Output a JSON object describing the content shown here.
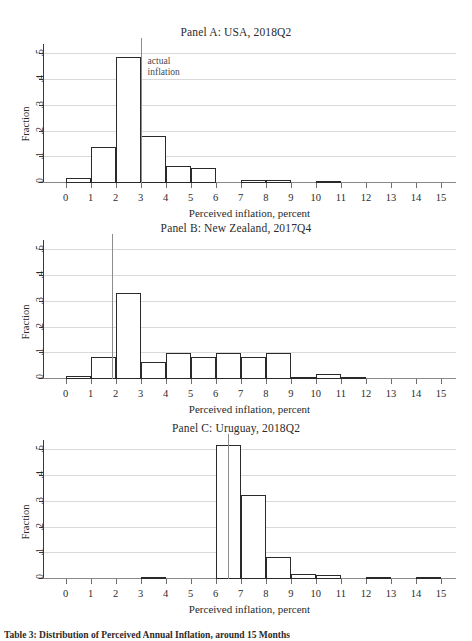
{
  "figure": {
    "caption": "Table 3: Distribution of Perceived Annual Inflation, around 15 Months"
  },
  "axes": {
    "xlabel": "Perceived inflation, percent",
    "ylabel": "Fraction",
    "xticks": [
      0,
      1,
      2,
      3,
      4,
      5,
      6,
      7,
      8,
      9,
      10,
      11,
      12,
      13,
      14,
      15
    ],
    "yticks": [
      "0",
      ".1",
      ".2",
      ".3",
      ".4",
      ".5"
    ],
    "xlim": [
      -0.9,
      15.6
    ],
    "ylim": [
      0,
      0.54
    ],
    "grid": true,
    "gridlines": [
      0.1,
      0.2,
      0.3,
      0.4,
      0.5
    ]
  },
  "annotation": {
    "line1": "actual",
    "line2": "inflation"
  },
  "colors": {
    "bar_fill": "#ffffff",
    "bar_edge": "#2a2a2a",
    "grid": "#d9d9d9",
    "axis": "#3a3a3a",
    "vline": "#8d8d8d",
    "text": "#2b2b2b"
  },
  "chart_data": [
    {
      "type": "bar",
      "title": "Panel A: USA, 2018Q2",
      "xlabel": "Perceived inflation, percent",
      "ylabel": "Fraction",
      "xlim": [
        -0.9,
        15.6
      ],
      "ylim": [
        0,
        0.54
      ],
      "grid": true,
      "bin_width": 1,
      "bin_starts": [
        0,
        1,
        2,
        3,
        4,
        5,
        7,
        8,
        10
      ],
      "values": [
        0.018,
        0.141,
        0.489,
        0.183,
        0.065,
        0.06,
        0.012,
        0.012,
        0.005
      ],
      "reference_line": {
        "x": 3.0,
        "label": "actual inflation"
      }
    },
    {
      "type": "bar",
      "title": "Panel B: New Zealand, 2017Q4",
      "xlabel": "Perceived inflation, percent",
      "ylabel": "Fraction",
      "xlim": [
        -0.9,
        15.6
      ],
      "ylim": [
        0,
        0.54
      ],
      "grid": true,
      "bin_width": 1,
      "bin_starts": [
        0,
        1,
        2,
        3,
        4,
        5,
        6,
        7,
        8,
        9,
        10,
        11
      ],
      "values": [
        0.013,
        0.085,
        0.335,
        0.065,
        0.1,
        0.086,
        0.1,
        0.086,
        0.1,
        0.008,
        0.018,
        0.006
      ],
      "reference_line": {
        "x": 1.85,
        "label": "actual inflation"
      }
    },
    {
      "type": "bar",
      "title": "Panel C: Uruguay, 2018Q2",
      "xlabel": "Perceived inflation, percent",
      "ylabel": "Fraction",
      "xlim": [
        -0.9,
        15.6
      ],
      "ylim": [
        0,
        0.54
      ],
      "grid": true,
      "bin_width": 1,
      "bin_starts": [
        3,
        6,
        7,
        8,
        9,
        10,
        12,
        14
      ],
      "values": [
        0.005,
        0.52,
        0.325,
        0.085,
        0.02,
        0.016,
        0.008,
        0.008
      ],
      "reference_line": {
        "x": 6.5,
        "label": "actual inflation"
      }
    }
  ]
}
